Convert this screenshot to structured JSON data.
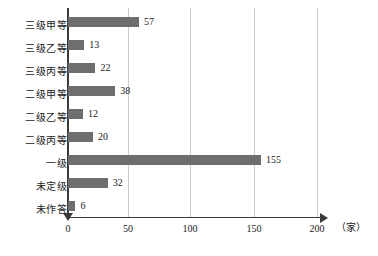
{
  "chart_data": {
    "type": "bar",
    "orientation": "horizontal",
    "title": "",
    "xlabel": "（家）",
    "ylabel": "",
    "xlim": [
      0,
      200
    ],
    "ylim": null,
    "grid": true,
    "legend": null,
    "x_ticks": [
      "0",
      "50",
      "100",
      "150",
      "200"
    ],
    "x_tick_values": [
      0,
      50,
      100,
      150,
      200
    ],
    "categories": [
      "三级甲等",
      "三级乙等",
      "三级丙等",
      "二级甲等",
      "二级乙等",
      "二级丙等",
      "一级",
      "未定级",
      "未作答"
    ],
    "values": [
      57,
      13,
      22,
      38,
      12,
      20,
      155,
      32,
      6
    ],
    "value_labels": [
      "57",
      "13",
      "22",
      "38",
      "12",
      "20",
      "155",
      "32",
      "6"
    ],
    "bar_color": "#6e6e6e",
    "gridline_color": "#c9c9c9",
    "axis_color": "#3a3a3a",
    "background_color": "#ffffff"
  },
  "axis": {
    "unit": "（家）"
  }
}
